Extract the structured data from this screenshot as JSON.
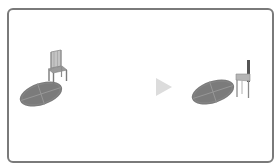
{
  "diagram": {
    "title_fragment": "",
    "left_scene": {
      "label": "before",
      "objects": [
        "rug",
        "chair-front-view"
      ]
    },
    "arrow": {
      "direction": "right",
      "color": "#dcdcdc"
    },
    "right_scene": {
      "label": "after",
      "objects": [
        "rug",
        "chair-side-view"
      ]
    },
    "colors": {
      "frame": "#7a7a7a",
      "rug": "#7b7b7b",
      "rug_lines": "#9a9a9a",
      "chair": "#8c8c8c",
      "chair_light": "#bdbdbd",
      "arrow": "#dcdcdc"
    }
  }
}
